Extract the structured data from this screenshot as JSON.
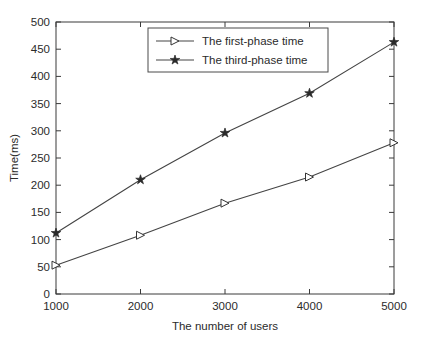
{
  "chart_data": {
    "type": "line",
    "title": "",
    "xlabel": "The number of users",
    "ylabel": "Time(ms)",
    "x": [
      1000,
      2000,
      3000,
      4000,
      5000
    ],
    "xticklabels": [
      "1000",
      "2000",
      "3000",
      "4000",
      "5000"
    ],
    "yticks": [
      0,
      50,
      100,
      150,
      200,
      250,
      300,
      350,
      400,
      450,
      500
    ],
    "yticklabels": [
      "0",
      "50",
      "100",
      "150",
      "200",
      "250",
      "300",
      "350",
      "400",
      "450",
      "500"
    ],
    "xlim": [
      1000,
      5000
    ],
    "ylim": [
      0,
      500
    ],
    "grid": false,
    "legend_position": "upper center",
    "series": [
      {
        "name": "The first-phase time",
        "marker": "right-triangle-open",
        "color": "#444444",
        "values": [
          53,
          108,
          167,
          215,
          278
        ]
      },
      {
        "name": "The third-phase time",
        "marker": "star-filled",
        "color": "#444444",
        "values": [
          112,
          210,
          296,
          369,
          463
        ]
      }
    ]
  },
  "legend": {
    "entries": [
      {
        "label": "The first-phase time"
      },
      {
        "label": "The third-phase time"
      }
    ]
  }
}
